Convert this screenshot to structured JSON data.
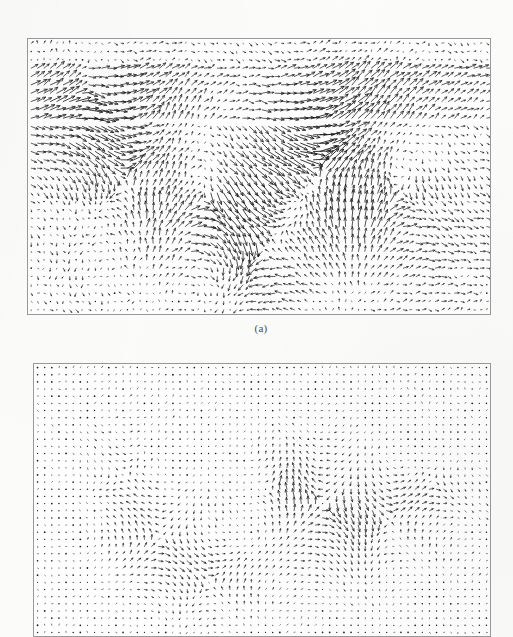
{
  "figure": {
    "kind": "scanned-figure",
    "page_background": "#fcfcfb",
    "panel_background": "#ffffff",
    "panel_border_color": "#9a9a9a",
    "vector_color": "#1a1a1a"
  },
  "panels": [
    {
      "id": "panel-a",
      "caption": "(a)",
      "frame": {
        "x": 27,
        "y": 38,
        "width": 464,
        "height": 277
      },
      "grid": {
        "cols": 72,
        "rows": 33
      },
      "description": "Vector field of turbulent shear flow with a central mixing layer"
    },
    {
      "id": "panel-b",
      "caption": "",
      "frame": {
        "x": 33,
        "y": 363,
        "width": 458,
        "height": 274
      },
      "grid": {
        "cols": 64,
        "rows": 38
      },
      "description": "Fluctuating velocity field after removal of convective mean, showing vortical structures"
    }
  ],
  "captions": [
    {
      "text": "(a)",
      "x": 181,
      "y": 322,
      "width": 160
    }
  ],
  "chart_data": [
    {
      "type": "quiver",
      "id": "panel-a",
      "title": "",
      "subtitle": "(a)",
      "xlabel": "",
      "ylabel": "",
      "xlim": [
        0,
        72
      ],
      "ylim": [
        0,
        33
      ],
      "grid": false,
      "legend": "none",
      "nx": 72,
      "ny": 33,
      "scale": 5.2,
      "arrowhead": 0.34,
      "bands": [
        {
          "y0": 0,
          "y1": 3,
          "u": 0.3,
          "v": 0.0,
          "note": "quiescent top strip, tiny rightward vectors"
        },
        {
          "y0": 3,
          "y1": 10,
          "u": 1.25,
          "v": 0.62,
          "note": "uniform up-right free stream (strong on right half)"
        },
        {
          "y0": 10,
          "y1": 13,
          "u": 1.05,
          "v": -0.18,
          "note": "upper edge of mixing layer, vectors flattening"
        },
        {
          "y0": 13,
          "y1": 16,
          "u": 1.35,
          "v": -0.1,
          "note": "high-speed core, long horizontal vectors"
        },
        {
          "y0": 16,
          "y1": 19,
          "u": 1.15,
          "v": -0.3,
          "note": "shear layer with down-right deflection"
        },
        {
          "y0": 19,
          "y1": 23,
          "u": 0.95,
          "v": 0.22,
          "note": "lower braid region, mixed directions"
        },
        {
          "y0": 23,
          "y1": 27,
          "u": 0.55,
          "v": 0.1,
          "note": "decaying vectors toward wall"
        },
        {
          "y0": 27,
          "y1": 33,
          "u": 0.32,
          "v": 0.0,
          "note": "near-wall small horizontal vectors"
        }
      ],
      "vortices": [
        {
          "cx": 14,
          "cy": 16,
          "strength": 1.5,
          "radius": 9,
          "sense": 1
        },
        {
          "cx": 27,
          "cy": 19,
          "strength": 1.2,
          "radius": 8,
          "sense": -1
        },
        {
          "cx": 44,
          "cy": 15,
          "strength": 1.6,
          "radius": 10,
          "sense": 1
        },
        {
          "cx": 57,
          "cy": 18,
          "strength": 1.1,
          "radius": 9,
          "sense": -1
        },
        {
          "cx": 36,
          "cy": 24,
          "strength": 1.3,
          "radius": 8,
          "sense": 1
        },
        {
          "cx": 8,
          "cy": 6,
          "strength": 1.0,
          "radius": 6,
          "sense": -1
        }
      ],
      "noise": 0.34,
      "seed": 20240517
    },
    {
      "type": "quiver",
      "id": "panel-b",
      "title": "",
      "subtitle": "",
      "xlabel": "",
      "ylabel": "",
      "xlim": [
        0,
        64
      ],
      "ylim": [
        0,
        38
      ],
      "grid": false,
      "legend": "none",
      "nx": 64,
      "ny": 38,
      "scale": 3.1,
      "arrowhead": 0.38,
      "bands": [
        {
          "y0": 0,
          "y1": 8,
          "u": 0.16,
          "v": 0.1,
          "note": "weak residual fluctuation, tiny up-right ticks"
        },
        {
          "y0": 8,
          "y1": 14,
          "u": 0.14,
          "v": 0.04,
          "note": "near-zero residual"
        },
        {
          "y0": 14,
          "y1": 22,
          "u": 0.2,
          "v": -0.04,
          "note": "active fluctuating band containing vortices"
        },
        {
          "y0": 22,
          "y1": 30,
          "u": 0.16,
          "v": 0.02,
          "note": "weaker fluctuating band"
        },
        {
          "y0": 30,
          "y1": 38,
          "u": 0.1,
          "v": 0.0,
          "note": "quiescent lower region, dot-like vectors"
        }
      ],
      "vortices": [
        {
          "cx": 40,
          "cy": 19,
          "strength": 1.9,
          "radius": 8,
          "sense": -1
        },
        {
          "cx": 49,
          "cy": 21,
          "strength": 1.4,
          "radius": 7,
          "sense": 1
        },
        {
          "cx": 17,
          "cy": 24,
          "strength": 1.3,
          "radius": 6,
          "sense": -1
        },
        {
          "cx": 24,
          "cy": 30,
          "strength": 1.1,
          "radius": 5,
          "sense": 1
        },
        {
          "cx": 33,
          "cy": 17,
          "strength": 1.0,
          "radius": 6,
          "sense": 1
        },
        {
          "cx": 55,
          "cy": 16,
          "strength": 0.9,
          "radius": 6,
          "sense": -1
        },
        {
          "cx": 12,
          "cy": 15,
          "strength": 0.8,
          "radius": 5,
          "sense": 1
        }
      ],
      "noise": 0.26,
      "seed": 77310294
    }
  ]
}
